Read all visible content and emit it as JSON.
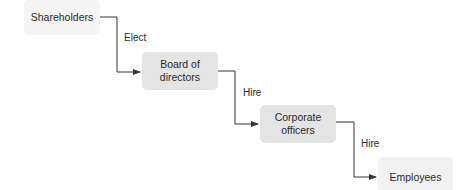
{
  "diagram": {
    "type": "hierarchy-flow",
    "nodes": [
      {
        "id": "shareholders",
        "label": "Shareholders"
      },
      {
        "id": "board",
        "label": "Board of\ndirectors",
        "line1": "Board of",
        "line2": "directors"
      },
      {
        "id": "officers",
        "label": "Corporate\nofficers",
        "line1": "Corporate",
        "line2": "officers"
      },
      {
        "id": "employees",
        "label": "Employees"
      }
    ],
    "edges": [
      {
        "from": "shareholders",
        "to": "board",
        "label": "Elect"
      },
      {
        "from": "board",
        "to": "officers",
        "label": "Hire"
      },
      {
        "from": "officers",
        "to": "employees",
        "label": "Hire"
      }
    ],
    "colors": {
      "line": "#333333",
      "node_fill_faint": "#f4f4f4",
      "node_fill_medium": "#e4e4e4",
      "text": "#2b2b2b"
    }
  }
}
